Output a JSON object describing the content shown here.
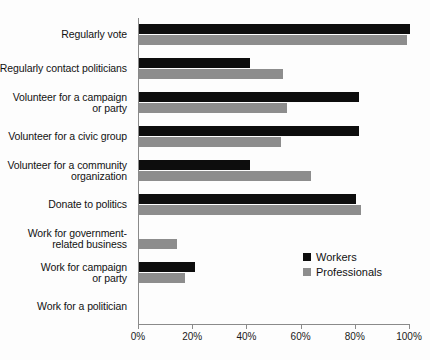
{
  "chart_data": {
    "type": "bar",
    "orientation": "horizontal",
    "title": "",
    "xlabel": "",
    "ylabel": "",
    "xlim": [
      0,
      100
    ],
    "xticks": [
      0,
      20,
      40,
      60,
      80,
      100
    ],
    "xtick_labels": [
      "0%",
      "20%",
      "40%",
      "60%",
      "80%",
      "100%"
    ],
    "grid": false,
    "legend_position": "center-right",
    "categories": [
      "Regularly vote",
      "Regularly contact politicians",
      "Volunteer for a campaign or party",
      "Volunteer for a civic group",
      "Volunteer for a community organization",
      "Donate to politics",
      "Work for government-related business",
      "Work for campaign or party",
      "Work for a politician"
    ],
    "category_lines": [
      [
        "Regularly vote"
      ],
      [
        "Regularly contact politicians"
      ],
      [
        "Volunteer for a campaign",
        "or party"
      ],
      [
        "Volunteer for a civic group"
      ],
      [
        "Volunteer for a community",
        "organization"
      ],
      [
        "Donate to politics"
      ],
      [
        "Work for government-",
        "related business"
      ],
      [
        "Work for campaign",
        "or party"
      ],
      [
        "Work for a politician"
      ]
    ],
    "series": [
      {
        "name": "Workers",
        "color": "#0d0d0d",
        "values": [
          100,
          41,
          81,
          81,
          41,
          80,
          0,
          20.5,
          0
        ]
      },
      {
        "name": "Professionals",
        "color": "#8d8d8d",
        "values": [
          99,
          53,
          54.5,
          52.5,
          63.5,
          82,
          14,
          17,
          0
        ]
      }
    ]
  },
  "legend": {
    "items": [
      {
        "label": "Workers",
        "swatch": "black-square-icon"
      },
      {
        "label": "Professionals",
        "swatch": "gray-square-icon"
      }
    ]
  }
}
